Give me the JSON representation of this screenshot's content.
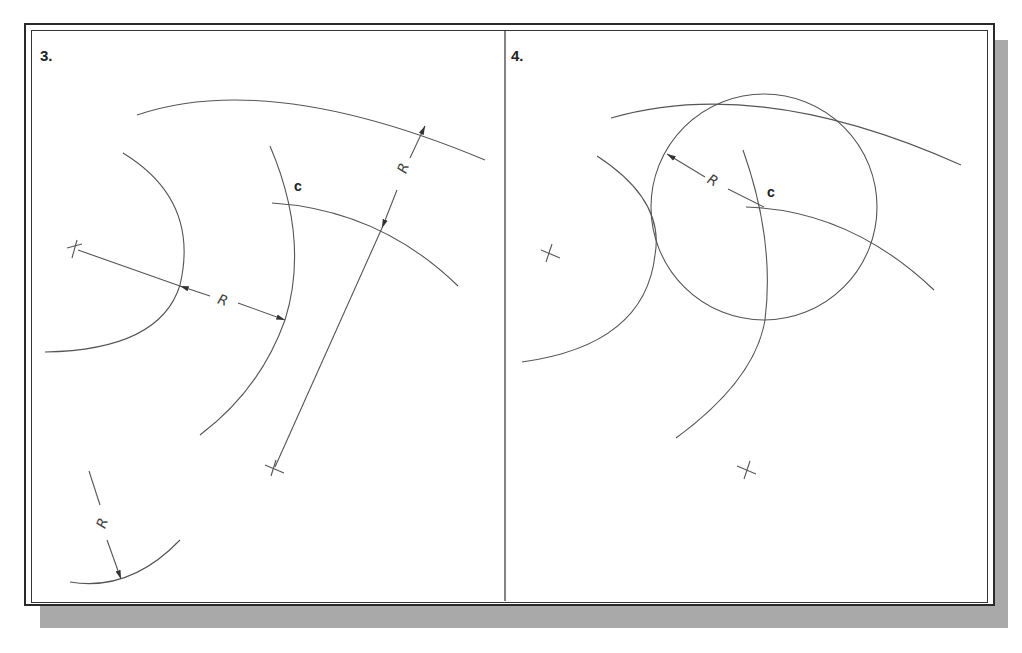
{
  "figure": {
    "panels": [
      {
        "step": "3.",
        "labels": {
          "point": "c",
          "radius": [
            "R",
            "R",
            "R"
          ]
        }
      },
      {
        "step": "4.",
        "labels": {
          "point": "c",
          "radius": [
            "R"
          ]
        }
      }
    ],
    "colors": {
      "line": "#444444",
      "frame": "#2a2a2a",
      "shadow": "#a9a9a9",
      "background": "#ffffff"
    }
  }
}
